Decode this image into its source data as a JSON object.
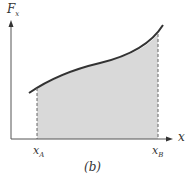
{
  "figure": {
    "y_axis_label": "F",
    "y_axis_sub": "x",
    "x_axis_label": "x",
    "x_a_label": "x",
    "x_a_sub": "A",
    "x_b_label": "x",
    "x_b_sub": "B",
    "caption": "(b)",
    "colors": {
      "curve": "#333333",
      "fill": "#d9d9d9",
      "axis": "#555555"
    }
  }
}
